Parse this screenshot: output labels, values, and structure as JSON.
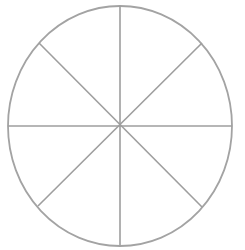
{
  "figure": {
    "name": "circle-divided-into-eight-sectors",
    "background_color": "#ffffff",
    "stroke_color": "#a0a0a0",
    "outline_stroke_color": "#a3a3a3",
    "divider_stroke_color": "#9e9e9e",
    "outline_stroke_width": 1.8,
    "divider_stroke_width": 1.6,
    "sector_count": 8,
    "sector_angle_degrees": 45,
    "center": {
      "x": 120,
      "y": 126
    },
    "radius_x": 112,
    "radius_y": 120,
    "bounds": {
      "left": 8,
      "top": 6,
      "right": 232,
      "bottom": 245
    },
    "dividers": [
      {
        "name": "vertical-diameter",
        "angle_degrees": 90,
        "x1": 120,
        "y1": 6,
        "x2": 120,
        "y2": 245
      },
      {
        "name": "horizontal-diameter",
        "angle_degrees": 0,
        "x1": 8,
        "y1": 126,
        "x2": 232,
        "y2": 126
      },
      {
        "name": "diagonal-diameter-nw-se",
        "angle_degrees": 135,
        "x1": 39,
        "y1": 43,
        "x2": 202,
        "y2": 207
      },
      {
        "name": "diagonal-diameter-ne-sw",
        "angle_degrees": 45,
        "x1": 202,
        "y1": 43,
        "x2": 38,
        "y2": 206
      }
    ],
    "sectors": [
      {
        "name": "sector-1",
        "start_angle_degrees": 0,
        "end_angle_degrees": 45
      },
      {
        "name": "sector-2",
        "start_angle_degrees": 45,
        "end_angle_degrees": 90
      },
      {
        "name": "sector-3",
        "start_angle_degrees": 90,
        "end_angle_degrees": 135
      },
      {
        "name": "sector-4",
        "start_angle_degrees": 135,
        "end_angle_degrees": 180
      },
      {
        "name": "sector-5",
        "start_angle_degrees": 180,
        "end_angle_degrees": 225
      },
      {
        "name": "sector-6",
        "start_angle_degrees": 225,
        "end_angle_degrees": 270
      },
      {
        "name": "sector-7",
        "start_angle_degrees": 270,
        "end_angle_degrees": 315
      },
      {
        "name": "sector-8",
        "start_angle_degrees": 315,
        "end_angle_degrees": 360
      }
    ],
    "labels": []
  }
}
